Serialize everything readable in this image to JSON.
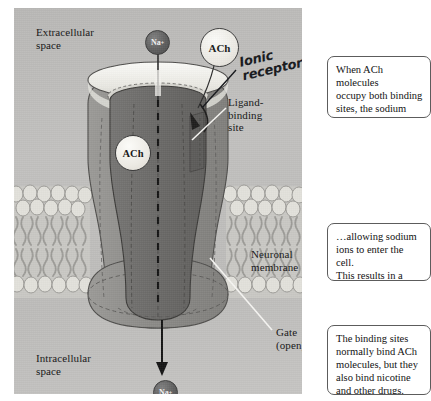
{
  "figure": {
    "labels": {
      "extracellular_space": "Extracellular\nspace",
      "intracellular_space": "Intracellular\nspace",
      "ligand_binding_site": "Ligand-\nbinding\nsite",
      "neuronal_membrane": "Neuronal\nmembrane",
      "gate_open": "Gate\n(open)"
    },
    "handwritten_annotation": "Ionic\nreceptor",
    "ions": {
      "sodium_top": "Na",
      "sodium_top_charge": "+",
      "sodium_bottom": "Na",
      "sodium_bottom_charge": "+"
    },
    "molecules": {
      "ach_extracellular": "ACh",
      "ach_bound": "ACh"
    },
    "colors": {
      "panel_background": "#c0bfbd",
      "protein_outer": "#8e8d8b",
      "protein_inner": "#6d6c6a",
      "pore_highlight": "#f4f3ef",
      "ion_fill": "#5e5e5e",
      "ach_fill": "#edebe5",
      "leader_line": "#f5f5f2",
      "membrane_head": "#d9d8d2",
      "membrane_tail": "#a8a7a3",
      "annotation_ink": "#16181c",
      "callout_border": "#5c5c5c"
    }
  },
  "callouts": [
    {
      "id": "callout-ach-binding",
      "text": "When ACh molecules\noccupy both binding\nsites, the sodium\nchannel opens…"
    },
    {
      "id": "callout-depolarization",
      "text": "…allowing sodium\nions to enter the cell.\nThis results in a\nlocal depolarization."
    },
    {
      "id": "callout-binding-sites",
      "text": "The binding sites\nnormally bind ACh\nmolecules, but they\nalso bind nicotine\nand other drugs."
    }
  ]
}
